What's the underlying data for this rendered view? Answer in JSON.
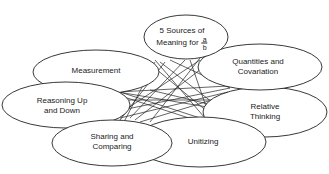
{
  "diagram": {
    "center_node": {
      "line1": "5 Sources of",
      "line2": "Meaning for",
      "fraction_numerator": "a",
      "fraction_denominator": "b"
    },
    "nodes": [
      {
        "id": "quantities",
        "line1": "Quantities and",
        "line2": "Covariation"
      },
      {
        "id": "measurement",
        "line1": "Measurement",
        "line2": ""
      },
      {
        "id": "relative",
        "line1": "Relative",
        "line2": "Thinking"
      },
      {
        "id": "reasoning",
        "line1": "Reasoning Up",
        "line2": "and Down"
      },
      {
        "id": "sharing",
        "line1": "Sharing and",
        "line2": "Comparing"
      },
      {
        "id": "unitizing",
        "line1": "Unitizing",
        "line2": ""
      }
    ],
    "colors": {
      "stroke": "#222222",
      "fill": "#ffffff",
      "text": "#222222"
    }
  }
}
